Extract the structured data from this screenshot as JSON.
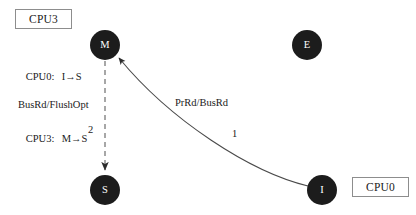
{
  "diagram": {
    "kind": "mesi-state-transition",
    "background_color": "#ffffff",
    "node_fill_color": "#1c1c1c",
    "node_text_color": "#ffffff",
    "edge_color": "#4a4a4a",
    "box_border_color": "#8d8d8d",
    "text_color": "#1a1a1a"
  },
  "cpu_boxes": [
    {
      "id": "cpu3",
      "label": "CPU3"
    },
    {
      "id": "cpu0",
      "label": "CPU0"
    }
  ],
  "transitions": [
    {
      "who": "CPU0:",
      "change": "I→S"
    },
    {
      "who": "CPU3:",
      "change": "M→S"
    }
  ],
  "nodes": [
    {
      "id": "m",
      "label": "M",
      "cx": 105,
      "cy": 45,
      "r": 15
    },
    {
      "id": "e",
      "label": "E",
      "cx": 307,
      "cy": 45,
      "r": 15
    },
    {
      "id": "s",
      "label": "S",
      "cx": 105,
      "cy": 190,
      "r": 15
    },
    {
      "id": "i",
      "label": "I",
      "cx": 322,
      "cy": 190,
      "r": 15
    }
  ],
  "edges": [
    {
      "id": "edge-m-to-s",
      "from": "M",
      "to": "S",
      "style": "dashed",
      "label": "BusRd/FlushOpt",
      "order": "2"
    },
    {
      "id": "edge-i-to-m",
      "from": "I",
      "to": "M",
      "style": "solid",
      "label": "PrRd/BusRd",
      "order": "1"
    }
  ]
}
